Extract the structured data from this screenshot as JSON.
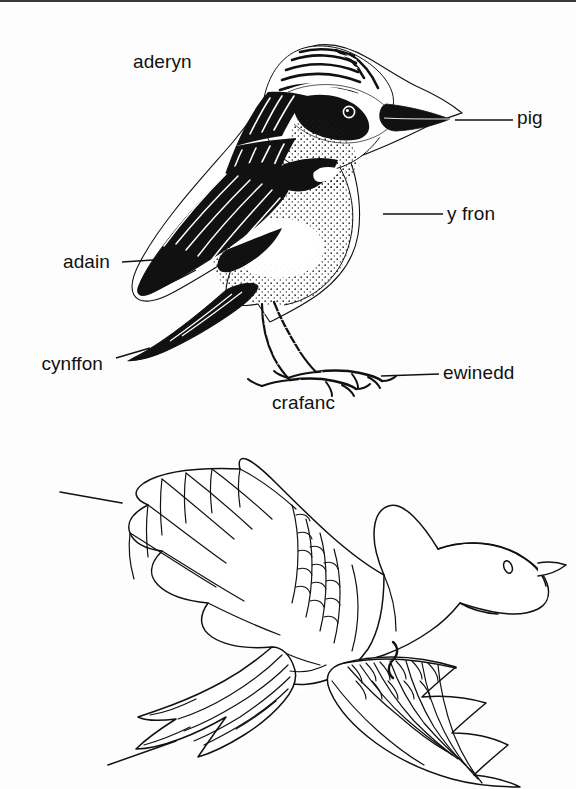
{
  "page": {
    "language": "Welsh",
    "background_color": "#fdfdfd",
    "ink_color": "#111111"
  },
  "figures": [
    {
      "id": "perched-bird",
      "description": "Perched songbird, detailed engraving style, facing right",
      "labels": [
        {
          "id": "aderyn",
          "text": "aderyn",
          "leader": false
        },
        {
          "id": "pig",
          "text": "pig",
          "leader": true
        },
        {
          "id": "y-fron",
          "text": "y fron",
          "leader": true
        },
        {
          "id": "adain",
          "text": "adain",
          "leader": true
        },
        {
          "id": "cynffon",
          "text": "cynffon",
          "leader": true
        },
        {
          "id": "ewinedd",
          "text": "ewinedd",
          "leader": true
        },
        {
          "id": "crafanc",
          "text": "crafanc",
          "leader": false
        }
      ]
    },
    {
      "id": "flying-bird",
      "description": "Bird in flight, outline line-art, wings spread",
      "labels": [
        {
          "id": "pluen",
          "text": "pluen",
          "leader": true
        },
        {
          "id": "adain",
          "text": "adain",
          "leader": true
        },
        {
          "id": "cynffon",
          "text": "cynffon",
          "leader": true
        }
      ]
    }
  ],
  "labels": {
    "aderyn": "aderyn",
    "pig": "pig",
    "y_fron": "y fron",
    "adain_perched": "adain",
    "cynffon_perched": "cynffon",
    "ewinedd": "ewinedd",
    "crafanc": "crafanc",
    "pluen": "pluen",
    "adain_flying": "adain",
    "cynffon_flying": "cynffon"
  }
}
